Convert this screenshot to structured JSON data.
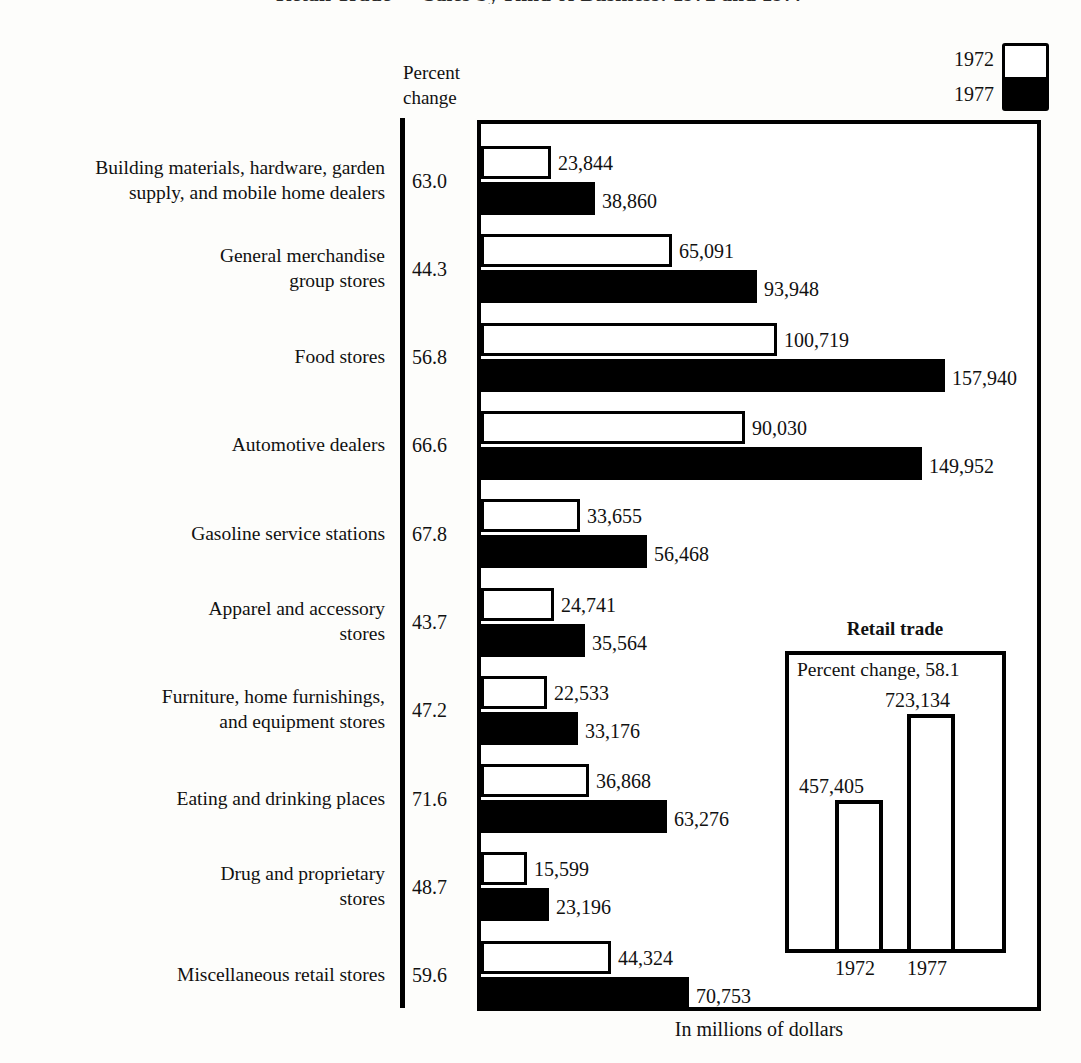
{
  "title": "Retail Trade — Sales by Kind of Business: 1972 and 1977",
  "percent_change_heading_line1": "Percent",
  "percent_change_heading_line2": "change",
  "legend": {
    "top_label": "1972",
    "bottom_label": "1977",
    "top_color": "#ffffff",
    "bottom_color": "#000000"
  },
  "footer_note": "In millions of dollars",
  "inset": {
    "title": "Retail trade",
    "percent_change_text": "Percent change, 58.1",
    "bars": [
      {
        "year": "1972",
        "value_label": "457,405",
        "value": 457405
      },
      {
        "year": "1977",
        "value_label": "723,134",
        "value": 723134
      }
    ]
  },
  "chart_data": {
    "type": "bar",
    "title": "Retail Trade — Sales by Kind of Business: 1972 and 1977",
    "orientation": "horizontal",
    "grouped": true,
    "xlabel": "In millions of dollars",
    "ylabel": "",
    "grid": false,
    "legend_position": "top-right",
    "xlim": [
      0,
      160000
    ],
    "series": [
      {
        "name": "1972",
        "color": "#ffffff",
        "values": [
          23844,
          65091,
          100719,
          90030,
          33655,
          24741,
          22533,
          36868,
          15599,
          44324
        ]
      },
      {
        "name": "1977",
        "color": "#000000",
        "values": [
          38860,
          93948,
          157940,
          149952,
          56468,
          35564,
          33176,
          63276,
          23196,
          70753
        ]
      }
    ],
    "categories": [
      "Building materials, hardware, garden supply, and mobile home dealers",
      "General merchandise group stores",
      "Food stores",
      "Automotive dealers",
      "Gasoline service stations",
      "Apparel and accessory stores",
      "Furniture, home furnishings, and equipment stores",
      "Eating and drinking places",
      "Drug and proprietary stores",
      "Miscellaneous retail stores"
    ],
    "percent_change": [
      63.0,
      44.3,
      56.8,
      66.6,
      67.8,
      43.7,
      47.2,
      71.6,
      48.7,
      59.6
    ],
    "value_labels_1972": [
      "23,844",
      "65,091",
      "100,719",
      "90,030",
      "33,655",
      "24,741",
      "22,533",
      "36,868",
      "15,599",
      "44,324"
    ],
    "value_labels_1977": [
      "38,860",
      "93,948",
      "157,940",
      "149,952",
      "56,468",
      "35,564",
      "33,176",
      "63,276",
      "23,196",
      "70,753"
    ],
    "inset_chart": {
      "type": "bar",
      "title": "Retail trade",
      "annotation": "Percent change, 58.1",
      "categories": [
        "1972",
        "1977"
      ],
      "values": [
        457405,
        723134
      ],
      "value_labels": [
        "457,405",
        "723,134"
      ]
    }
  },
  "rows": [
    {
      "label_line1": "Building materials, hardware, garden",
      "label_line2": "supply, and mobile home dealers",
      "pct": "63.0",
      "v1972": "23,844",
      "v1977": "38,860"
    },
    {
      "label_line1": "General merchandise",
      "label_line2": "group stores",
      "pct": "44.3",
      "v1972": "65,091",
      "v1977": "93,948"
    },
    {
      "label_line1": "Food stores",
      "label_line2": "",
      "pct": "56.8",
      "v1972": "100,719",
      "v1977": "157,940"
    },
    {
      "label_line1": "Automotive dealers",
      "label_line2": "",
      "pct": "66.6",
      "v1972": "90,030",
      "v1977": "149,952"
    },
    {
      "label_line1": "Gasoline service stations",
      "label_line2": "",
      "pct": "67.8",
      "v1972": "33,655",
      "v1977": "56,468"
    },
    {
      "label_line1": "Apparel and accessory",
      "label_line2": "stores",
      "pct": "43.7",
      "v1972": "24,741",
      "v1977": "35,564"
    },
    {
      "label_line1": "Furniture, home furnishings,",
      "label_line2": "and equipment stores",
      "pct": "47.2",
      "v1972": "22,533",
      "v1977": "33,176"
    },
    {
      "label_line1": "Eating and drinking places",
      "label_line2": "",
      "pct": "71.6",
      "v1972": "36,868",
      "v1977": "63,276"
    },
    {
      "label_line1": "Drug and proprietary",
      "label_line2": "stores",
      "pct": "48.7",
      "v1972": "15,599",
      "v1977": "23,196"
    },
    {
      "label_line1": "Miscellaneous retail stores",
      "label_line2": "",
      "pct": "59.6",
      "v1972": "44,324",
      "v1977": "70,753"
    }
  ]
}
